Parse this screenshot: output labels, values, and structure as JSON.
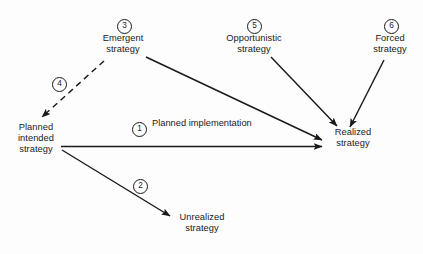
{
  "diagram": {
    "background_color": "#fdfdfd",
    "stroke_color": "#1a1a1a",
    "text_color": "#1a1a1a",
    "nodes": [
      {
        "id": "emergent",
        "lines": [
          "Emergent",
          "strategy"
        ],
        "x": 95,
        "y": 33,
        "width": 56
      },
      {
        "id": "opportunistic",
        "lines": [
          "Opportunistic",
          "strategy"
        ],
        "x": 219,
        "y": 33,
        "width": 70
      },
      {
        "id": "forced",
        "lines": [
          "Forced",
          "strategy"
        ],
        "x": 364,
        "y": 33,
        "width": 52
      },
      {
        "id": "planned-intended",
        "lines": [
          "Planned",
          "intended",
          "strategy"
        ],
        "x": 12,
        "y": 122,
        "width": 48
      },
      {
        "id": "realized",
        "lines": [
          "Realized",
          "strategy"
        ],
        "x": 329,
        "y": 127,
        "width": 48
      },
      {
        "id": "unrealized",
        "lines": [
          "Unrealized",
          "strategy"
        ],
        "x": 174,
        "y": 212,
        "width": 56
      }
    ],
    "edge_labels": [
      {
        "id": "planned-implementation",
        "lines": [
          "Planned",
          "implementation"
        ],
        "x": 152,
        "y": 118,
        "width": 72
      }
    ],
    "badges": [
      {
        "id": "badge-1",
        "number": "1",
        "x": 132,
        "y": 122
      },
      {
        "id": "badge-2",
        "number": "2",
        "x": 133,
        "y": 179
      },
      {
        "id": "badge-3",
        "number": "3",
        "x": 117,
        "y": 19
      },
      {
        "id": "badge-4",
        "number": "4",
        "x": 52,
        "y": 77
      },
      {
        "id": "badge-5",
        "number": "5",
        "x": 247,
        "y": 19
      },
      {
        "id": "badge-6",
        "number": "6",
        "x": 384,
        "y": 19
      }
    ],
    "edges": [
      {
        "id": "edge-1-planned-implementation",
        "number": "1",
        "from": "planned-intended",
        "to": "realized",
        "style": "solid",
        "path": "M 61 146.5 L 322 146.5"
      },
      {
        "id": "edge-2-unrealized",
        "number": "2",
        "from": "planned-intended",
        "to": "unrealized",
        "style": "solid",
        "path": "M 62 150 L 170 216"
      },
      {
        "id": "edge-3-emergent-to-realized",
        "number": "3",
        "from": "emergent",
        "to": "realized",
        "style": "solid",
        "path": "M 146 57 L 322 140"
      },
      {
        "id": "edge-4-emergent-to-planned",
        "number": "4",
        "from": "emergent",
        "to": "planned-intended",
        "style": "dashed",
        "path": "M 104 61 L 42 117"
      },
      {
        "id": "edge-5-opportunistic-to-realized",
        "number": "5",
        "from": "opportunistic",
        "to": "realized",
        "style": "solid",
        "path": "M 271 57 L 337 126"
      },
      {
        "id": "edge-6-forced-to-realized",
        "number": "6",
        "from": "forced",
        "to": "realized",
        "style": "solid",
        "path": "M 384 60 L 350 127"
      }
    ]
  }
}
